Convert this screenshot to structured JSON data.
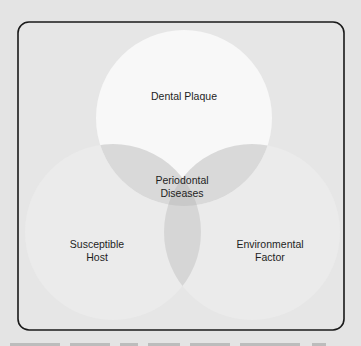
{
  "diagram": {
    "type": "venn",
    "title": "",
    "sets": [
      {
        "id": "top",
        "label": "Dental Plaque"
      },
      {
        "id": "left",
        "label": "Susceptible\nHost"
      },
      {
        "id": "right",
        "label": "Environmental\nFactor"
      }
    ],
    "intersection_label": "Periodontal\nDiseases",
    "colors": {
      "background": "#e4e4e4",
      "frame_border": "#1a1a1a",
      "top_circle": "#f8f8f8",
      "side_circle": "#ebebeb",
      "pair_overlap": "#d8d8d8",
      "triple_overlap": "#c9c9c9"
    }
  },
  "caption": {
    "visible": "partially clipped, illegible"
  }
}
